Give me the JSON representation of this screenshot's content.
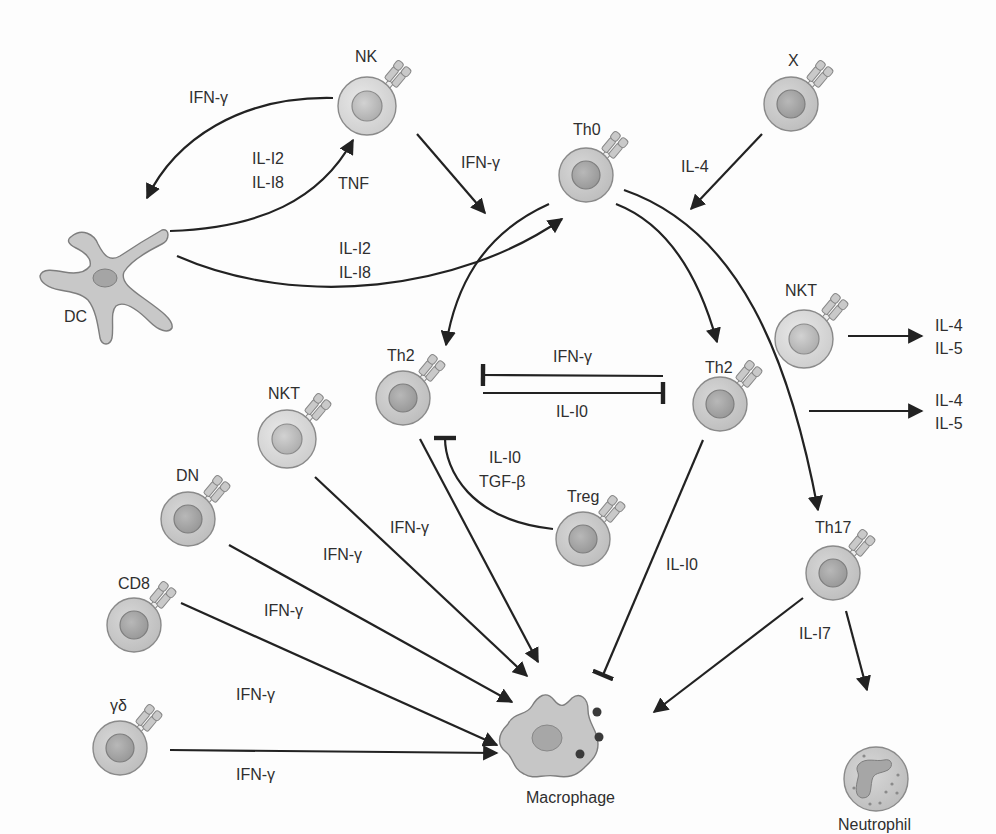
{
  "colors": {
    "cell_fill": "#cfcfcf",
    "cell_stroke": "#8a8a8a",
    "nucleus_fill": "#a9a9a9",
    "light_cell_fill": "#dedede",
    "arrow": "#222222",
    "text": "#2f2f2f"
  },
  "cells": {
    "nk": {
      "label": "NK"
    },
    "x": {
      "label": "X"
    },
    "th0": {
      "label": "Th0"
    },
    "dc": {
      "label": "DC"
    },
    "th2_left": {
      "label": "Th2"
    },
    "th2_right": {
      "label": "Th2"
    },
    "nkt_right": {
      "label": "NKT"
    },
    "nkt_left": {
      "label": "NKT"
    },
    "dn": {
      "label": "DN"
    },
    "cd8": {
      "label": "CD8"
    },
    "gd": {
      "label": "γδ"
    },
    "treg": {
      "label": "Treg"
    },
    "th17": {
      "label": "Th17"
    },
    "macrophage": {
      "label": "Macrophage"
    },
    "neutrophil": {
      "label": "Neutrophil"
    }
  },
  "edges": {
    "nk_to_dc": {
      "label": "IFN-γ"
    },
    "dc_to_nk": {
      "label_1": "IL-I2",
      "label_2": "IL-I8",
      "label_3": "TNF"
    },
    "nk_to_th0": {
      "label": "IFN-γ"
    },
    "dc_to_th0": {
      "label_1": "IL-I2",
      "label_2": "IL-I8"
    },
    "x_to_th0": {
      "label": "IL-4"
    },
    "th2r_inhibits_th2l": {
      "label": "IFN-γ"
    },
    "th2l_inhibits_th2r": {
      "label": "IL-I0"
    },
    "treg_inhibits_th2l": {
      "label_1": "IL-I0",
      "label_2": "TGF-β"
    },
    "nkt_right_out": {
      "label_1": "IL-4",
      "label_2": "IL-5"
    },
    "th2_right_out": {
      "label_1": "IL-4",
      "label_2": "IL-5"
    },
    "th2l_to_mac": {
      "label": "IFN-γ"
    },
    "nktl_to_mac": {
      "label": "IFN-γ"
    },
    "dn_to_mac": {
      "label": "IFN-γ"
    },
    "cd8_to_mac": {
      "label": "IFN-γ"
    },
    "gd_to_mac": {
      "label": "IFN-γ"
    },
    "th2r_inhibits_mac": {
      "label": "IL-I0"
    },
    "th17_to_mac_neut": {
      "label": "IL-I7"
    }
  }
}
